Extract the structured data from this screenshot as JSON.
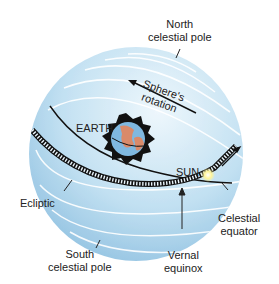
{
  "diagram": {
    "labels": {
      "north_pole": [
        "North",
        "celestial pole"
      ],
      "rotation": [
        "Sphere's",
        "rotation"
      ],
      "earth": "EARTH",
      "sun": "SUN",
      "ecliptic": "Ecliptic",
      "celestial_equator": [
        "Celestial",
        "equator"
      ],
      "vernal_equinox": [
        "Vernal",
        "equinox"
      ],
      "south_pole": [
        "South",
        "celestial pole"
      ]
    },
    "colors": {
      "sphere_light": "#e4f2fa",
      "sphere_mid": "#b9dcef",
      "sphere_dark": "#8fc0e0",
      "line": "#111111",
      "sun": "#fff59a",
      "earth_ocean": "#7fb8e0",
      "earth_land": "#d98a6a"
    }
  }
}
